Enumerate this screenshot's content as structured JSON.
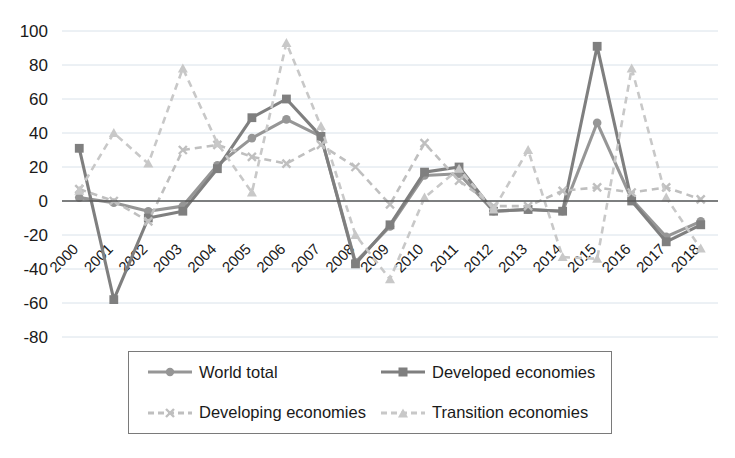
{
  "chart_data": {
    "type": "line",
    "title": "",
    "xlabel": "",
    "ylabel": "",
    "ylim": [
      -80,
      100
    ],
    "ytick_step": 20,
    "yticks": [
      100,
      80,
      60,
      40,
      20,
      0,
      -20,
      -40,
      -60,
      -80
    ],
    "grid": true,
    "legend_position": "bottom",
    "categories": [
      "2000",
      "2001",
      "2002",
      "2003",
      "2004",
      "2005",
      "2006",
      "2007",
      "2008",
      "2009",
      "2010",
      "2011",
      "2012",
      "2013",
      "2014",
      "2015",
      "2016",
      "2017",
      "2018"
    ],
    "series": [
      {
        "name": "World total",
        "marker": "circle",
        "dash": "solid",
        "color": "#969696",
        "values": [
          2,
          -1,
          -6,
          -3,
          21,
          37,
          48,
          38,
          -36,
          -15,
          15,
          16,
          -6,
          -5,
          -6,
          46,
          1,
          -21,
          -12
        ]
      },
      {
        "name": "Developed economies",
        "marker": "square",
        "dash": "solid",
        "color": "#7f7f7f",
        "values": [
          31,
          -58,
          -10,
          -6,
          19,
          49,
          60,
          38,
          -37,
          -14,
          17,
          20,
          -6,
          -5,
          -6,
          91,
          0,
          -24,
          -14
        ]
      },
      {
        "name": "Developing economies",
        "marker": "x",
        "dash": "dashed",
        "color": "#bfbfbf",
        "values": [
          7,
          0,
          -12,
          30,
          33,
          26,
          22,
          33,
          20,
          -2,
          34,
          12,
          -3,
          -3,
          6,
          8,
          5,
          8,
          1
        ]
      },
      {
        "name": "Transition economies",
        "marker": "triangle",
        "dash": "dashed",
        "color": "#c8c8c8",
        "values": [
          6,
          40,
          22,
          78,
          34,
          5,
          93,
          44,
          -20,
          -46,
          2,
          19,
          -5,
          30,
          -33,
          -34,
          78,
          2,
          -28
        ]
      }
    ]
  },
  "legend": {
    "items": [
      {
        "label": "World total",
        "marker": "circle-marker-icon"
      },
      {
        "label": "Developed economies",
        "marker": "square-marker-icon"
      },
      {
        "label": "Developing economies",
        "marker": "x-marker-icon"
      },
      {
        "label": "Transition economies",
        "marker": "triangle-marker-icon"
      }
    ]
  },
  "colors": {
    "world_total": "#969696",
    "developed": "#7f7f7f",
    "developing": "#bfbfbf",
    "transition": "#c8c8c8",
    "gridline": "#d9e2ea",
    "zeroline": "#595959",
    "legend_border": "#7a7a7a",
    "background": "#ffffff"
  }
}
